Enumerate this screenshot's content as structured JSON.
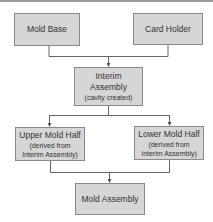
{
  "diagram": {
    "type": "flowchart",
    "nodes": [
      {
        "id": "mold_base",
        "label": "Mold Base"
      },
      {
        "id": "card_holder",
        "label": "Card Holder"
      },
      {
        "id": "interim",
        "label": "Interim",
        "label2": "Assembly",
        "sub": "(cavity created)"
      },
      {
        "id": "upper",
        "label": "Upper Mold Half",
        "sub1": "(derived from",
        "sub2": "Interim Assembly)"
      },
      {
        "id": "lower",
        "label": "Lower Mold Half",
        "sub1": "(derived from",
        "sub2": "Interim Assembly)"
      },
      {
        "id": "mold_assembly",
        "label": "Mold Assembly"
      }
    ],
    "edges": [
      {
        "from": "mold_base",
        "to": "interim"
      },
      {
        "from": "card_holder",
        "to": "interim"
      },
      {
        "from": "interim",
        "to": "upper"
      },
      {
        "from": "interim",
        "to": "lower"
      },
      {
        "from": "upper",
        "to": "mold_assembly"
      },
      {
        "from": "lower",
        "to": "mold_assembly"
      }
    ],
    "colors": {
      "box_fill": "#d6d6d6",
      "box_border": "#8a8a8a",
      "line": "#666666"
    }
  }
}
